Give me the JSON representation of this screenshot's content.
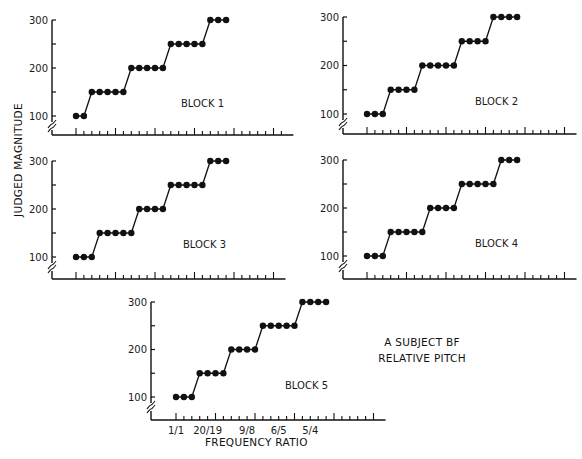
{
  "figure": {
    "y_axis_label": "JUDGED MAGNITUDE",
    "x_axis_label": "FREQUENCY RATIO",
    "annotation_line1": "A SUBJECT  BF",
    "annotation_line2": "RELATIVE PITCH",
    "x_tick_labels": [
      "1/1",
      "20/19",
      "9/8",
      "6/5",
      "5/4"
    ]
  },
  "colors": {
    "ink": "#111111",
    "background": "#ffffff"
  },
  "chart_data": [
    {
      "type": "line",
      "title": "BLOCK 1",
      "xlabel": "FREQUENCY RATIO",
      "ylabel": "JUDGED MAGNITUDE",
      "yticks": [
        100,
        200,
        300
      ],
      "ylim": [
        80,
        300
      ],
      "x": [
        1,
        2,
        3,
        4,
        5,
        6,
        7,
        8,
        9,
        10,
        11,
        12,
        13,
        14,
        15,
        16,
        17,
        18,
        19,
        20
      ],
      "values": [
        100,
        100,
        150,
        150,
        150,
        150,
        150,
        200,
        200,
        200,
        200,
        200,
        250,
        250,
        250,
        250,
        250,
        300,
        300,
        300
      ]
    },
    {
      "type": "line",
      "title": "BLOCK 2",
      "xlabel": "FREQUENCY RATIO",
      "ylabel": "JUDGED MAGNITUDE",
      "yticks": [
        100,
        200,
        300
      ],
      "ylim": [
        80,
        300
      ],
      "x": [
        1,
        2,
        3,
        4,
        5,
        6,
        7,
        8,
        9,
        10,
        11,
        12,
        13,
        14,
        15,
        16,
        17,
        18,
        19,
        20
      ],
      "values": [
        100,
        100,
        100,
        150,
        150,
        150,
        150,
        200,
        200,
        200,
        200,
        200,
        250,
        250,
        250,
        250,
        300,
        300,
        300,
        300
      ]
    },
    {
      "type": "line",
      "title": "BLOCK 3",
      "xlabel": "FREQUENCY RATIO",
      "ylabel": "JUDGED MAGNITUDE",
      "yticks": [
        100,
        200,
        300
      ],
      "ylim": [
        80,
        300
      ],
      "x": [
        1,
        2,
        3,
        4,
        5,
        6,
        7,
        8,
        9,
        10,
        11,
        12,
        13,
        14,
        15,
        16,
        17,
        18,
        19,
        20
      ],
      "values": [
        100,
        100,
        100,
        150,
        150,
        150,
        150,
        150,
        200,
        200,
        200,
        200,
        250,
        250,
        250,
        250,
        250,
        300,
        300,
        300
      ]
    },
    {
      "type": "line",
      "title": "BLOCK 4",
      "xlabel": "FREQUENCY RATIO",
      "ylabel": "JUDGED MAGNITUDE",
      "yticks": [
        100,
        200,
        300
      ],
      "ylim": [
        80,
        300
      ],
      "x": [
        1,
        2,
        3,
        4,
        5,
        6,
        7,
        8,
        9,
        10,
        11,
        12,
        13,
        14,
        15,
        16,
        17,
        18,
        19,
        20
      ],
      "values": [
        100,
        100,
        100,
        150,
        150,
        150,
        150,
        150,
        200,
        200,
        200,
        200,
        250,
        250,
        250,
        250,
        250,
        300,
        300,
        300
      ]
    },
    {
      "type": "line",
      "title": "BLOCK 5",
      "xlabel": "FREQUENCY RATIO",
      "ylabel": "JUDGED MAGNITUDE",
      "yticks": [
        100,
        200,
        300
      ],
      "ylim": [
        80,
        300
      ],
      "x": [
        1,
        2,
        3,
        4,
        5,
        6,
        7,
        8,
        9,
        10,
        11,
        12,
        13,
        14,
        15,
        16,
        17,
        18,
        19,
        20
      ],
      "x_tick_labels": {
        "1": "1/1",
        "5": "20/19",
        "10": "9/8",
        "14": "6/5",
        "18": "5/4"
      },
      "values": [
        100,
        100,
        100,
        150,
        150,
        150,
        150,
        200,
        200,
        200,
        200,
        250,
        250,
        250,
        250,
        250,
        300,
        300,
        300,
        300
      ]
    }
  ],
  "panels_layout": [
    {
      "axis_x": 52,
      "y300": 20,
      "y100": 116,
      "base": 135,
      "x0": 76,
      "dx": 7.9,
      "ticks": 27,
      "title_x": 181,
      "title_y": 107
    },
    {
      "axis_x": 343,
      "y300": 17,
      "y100": 114,
      "base": 134,
      "x0": 367,
      "dx": 7.9,
      "ticks": 26,
      "title_x": 475,
      "title_y": 105
    },
    {
      "axis_x": 52,
      "y300": 161,
      "y100": 257,
      "base": 279,
      "x0": 76,
      "dx": 7.9,
      "ticks": 26,
      "title_x": 183,
      "title_y": 248
    },
    {
      "axis_x": 343,
      "y300": 160,
      "y100": 256,
      "base": 279,
      "x0": 367,
      "dx": 7.9,
      "ticks": 26,
      "title_x": 475,
      "title_y": 247
    },
    {
      "axis_x": 151,
      "y300": 302,
      "y100": 397,
      "base": 420,
      "x0": 176,
      "dx": 7.9,
      "ticks": 26,
      "title_x": 285,
      "title_y": 389
    }
  ]
}
